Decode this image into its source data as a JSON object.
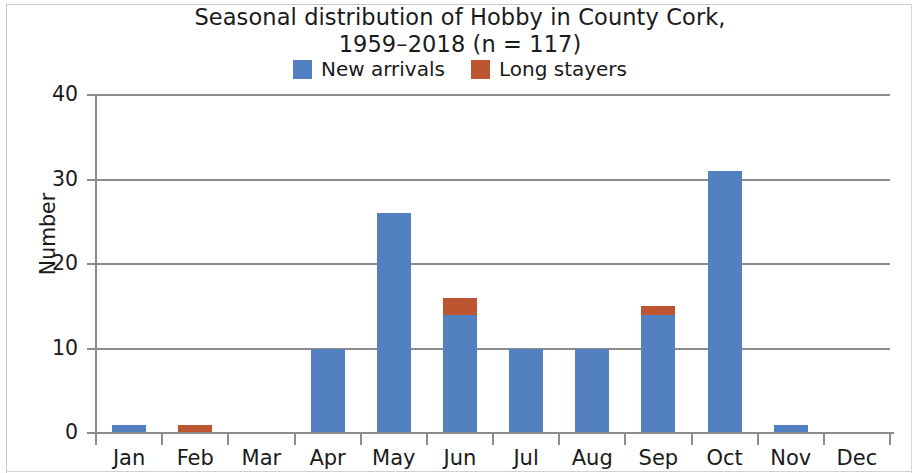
{
  "chart_data": {
    "type": "bar",
    "title": "Seasonal distribution of Hobby in County Cork, 1959–2018 (n = 117)",
    "title_lines": [
      "Seasonal distribution of Hobby in County Cork,",
      "1959–2018 (n = 117)"
    ],
    "xlabel": "",
    "ylabel": "Number",
    "ylim": [
      0,
      40
    ],
    "yticks": [
      0,
      10,
      20,
      30,
      40
    ],
    "ytick_labels": [
      "0",
      "10",
      "20",
      "30",
      "40"
    ],
    "grid": true,
    "stacked": true,
    "legend_position": "top-center",
    "categories": [
      "Jan",
      "Feb",
      "Mar",
      "Apr",
      "May",
      "Jun",
      "Jul",
      "Aug",
      "Sep",
      "Oct",
      "Nov",
      "Dec"
    ],
    "series": [
      {
        "name": "New arrivals",
        "color": "#5380c0",
        "values": [
          1,
          0,
          0,
          10,
          26,
          14,
          10,
          10,
          14,
          31,
          1,
          0
        ]
      },
      {
        "name": "Long stayers",
        "color": "#bd5630",
        "values": [
          0,
          1,
          0,
          0,
          0,
          2,
          0,
          0,
          1,
          0,
          0,
          0
        ]
      }
    ],
    "totals": [
      1,
      1,
      0,
      10,
      26,
      16,
      10,
      10,
      15,
      31,
      1,
      0
    ]
  },
  "colors": {
    "new_arrivals": "#5380c0",
    "long_stayers": "#bd5630",
    "axis": "#8c8c8c",
    "text": "#1a1a1a",
    "background": "#ffffff"
  }
}
